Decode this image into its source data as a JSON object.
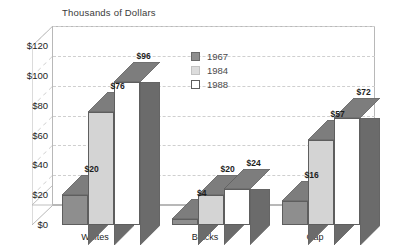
{
  "chart_data": {
    "type": "bar",
    "title": "Thousands of Dollars",
    "xlabel": "",
    "ylabel": "",
    "categories": [
      "Whites",
      "Blacks",
      "Gap"
    ],
    "series": [
      {
        "name": "1967",
        "values": [
          20,
          4,
          16
        ],
        "color": "#8e8e8e"
      },
      {
        "name": "1984",
        "values": [
          76,
          20,
          57
        ],
        "color": "#d4d4d4"
      },
      {
        "name": "1988",
        "values": [
          96,
          24,
          72
        ],
        "color": "#ffffff"
      }
    ],
    "value_labels": [
      [
        "$20",
        "$76",
        "$96"
      ],
      [
        "$4",
        "$20",
        "$24"
      ],
      [
        "$16",
        "$57",
        "$72"
      ]
    ],
    "ylim": [
      0,
      120
    ],
    "yticks": [
      0,
      20,
      40,
      60,
      80,
      100,
      120
    ],
    "ytick_labels": [
      "$0",
      "$20",
      "$40",
      "$60",
      "$80",
      "$100",
      "$120"
    ],
    "grid": true,
    "grid_style": "dashed",
    "legend_position": "inside-top-center",
    "three_d": true,
    "colors": {
      "series_1967_face": "#8e8e8e",
      "series_1984_face": "#d4d4d4",
      "series_1988_face": "#ffffff",
      "shade_dark": "#6b6b6b",
      "shade_top": "#7d7d7d",
      "outline": "#5e5e5e",
      "gridline": "#cfcfcf",
      "frame": "#b8b8b8",
      "text": "#1d1d1d",
      "title_text": "#3a3a3a"
    }
  },
  "legend": {
    "items": [
      {
        "label": "1967"
      },
      {
        "label": "1984"
      },
      {
        "label": "1988"
      }
    ]
  }
}
